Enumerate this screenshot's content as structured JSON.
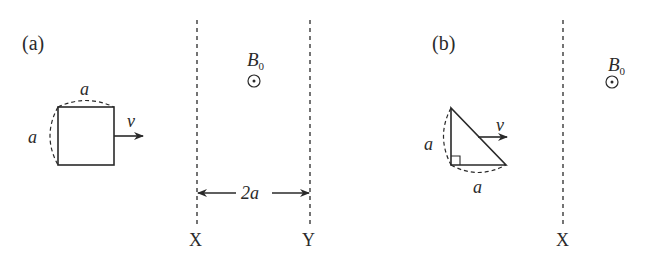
{
  "panel_a": {
    "label": "(a)",
    "loop_shape": "square",
    "side_top_label": "a",
    "side_left_label": "a",
    "velocity_label": "v",
    "field_label": "B",
    "field_subscript": "0",
    "field_direction": "out-of-page-icon",
    "width_label": "2a",
    "boundary_left": "X",
    "boundary_right": "Y"
  },
  "panel_b": {
    "label": "(b)",
    "loop_shape": "right-triangle",
    "side_left_label": "a",
    "side_bottom_label": "a",
    "velocity_label": "v",
    "field_label": "B",
    "field_subscript": "0",
    "field_direction": "out-of-page-icon",
    "boundary_left": "X"
  },
  "colors": {
    "ink": "#2a2a2a",
    "background": "#ffffff"
  }
}
